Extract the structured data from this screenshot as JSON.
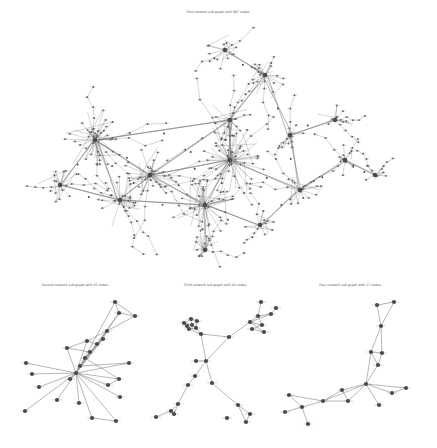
{
  "figure": {
    "background": "#ffffff",
    "node_color": "#4a4a4a",
    "edge_color": "#6a6a6a"
  },
  "main_graph": {
    "title": "First network sub-graph with 987 nodes",
    "node_count": 987,
    "hubs": [
      {
        "x": 95,
        "y": 140,
        "r": 14,
        "n": 40
      },
      {
        "x": 230,
        "y": 160,
        "r": 16,
        "n": 45
      },
      {
        "x": 150,
        "y": 175,
        "r": 13,
        "n": 30
      },
      {
        "x": 205,
        "y": 205,
        "r": 14,
        "n": 32
      },
      {
        "x": 120,
        "y": 200,
        "r": 12,
        "n": 24
      },
      {
        "x": 300,
        "y": 190,
        "r": 10,
        "n": 20
      },
      {
        "x": 265,
        "y": 75,
        "r": 10,
        "n": 18
      },
      {
        "x": 225,
        "y": 50,
        "r": 9,
        "n": 14
      },
      {
        "x": 230,
        "y": 120,
        "r": 10,
        "n": 18
      },
      {
        "x": 335,
        "y": 120,
        "r": 8,
        "n": 12
      },
      {
        "x": 345,
        "y": 160,
        "r": 7,
        "n": 10
      },
      {
        "x": 205,
        "y": 250,
        "r": 8,
        "n": 12
      },
      {
        "x": 60,
        "y": 185,
        "r": 9,
        "n": 14
      },
      {
        "x": 290,
        "y": 135,
        "r": 7,
        "n": 10
      },
      {
        "x": 375,
        "y": 175,
        "r": 6,
        "n": 8
      },
      {
        "x": 260,
        "y": 225,
        "r": 8,
        "n": 10
      }
    ],
    "hub_edges": [
      [
        0,
        2
      ],
      [
        0,
        4
      ],
      [
        0,
        12
      ],
      [
        1,
        2
      ],
      [
        1,
        3
      ],
      [
        1,
        5
      ],
      [
        1,
        8
      ],
      [
        2,
        3
      ],
      [
        2,
        4
      ],
      [
        3,
        11
      ],
      [
        3,
        15
      ],
      [
        5,
        10
      ],
      [
        5,
        13
      ],
      [
        6,
        7
      ],
      [
        6,
        8
      ],
      [
        8,
        1
      ],
      [
        9,
        13
      ],
      [
        10,
        14
      ],
      [
        4,
        12
      ],
      [
        15,
        5
      ],
      [
        6,
        13
      ],
      [
        8,
        2
      ],
      [
        0,
        8
      ],
      [
        3,
        4
      ]
    ]
  },
  "subgraphs": [
    {
      "title": "Second network sub-graph with 25 nodes",
      "node_count": 25,
      "nodes": [
        [
          115,
          302
        ],
        [
          119,
          313
        ],
        [
          135,
          316
        ],
        [
          107,
          331
        ],
        [
          103,
          339
        ],
        [
          87,
          341
        ],
        [
          97,
          344
        ],
        [
          67,
          348
        ],
        [
          90,
          352
        ],
        [
          85,
          358
        ],
        [
          80,
          366
        ],
        [
          76,
          373
        ],
        [
          26,
          363
        ],
        [
          32,
          374
        ],
        [
          39,
          387
        ],
        [
          129,
          363
        ],
        [
          119,
          379
        ],
        [
          70,
          379
        ],
        [
          57,
          400
        ],
        [
          79,
          403
        ],
        [
          108,
          385
        ],
        [
          120,
          397
        ],
        [
          25,
          411
        ],
        [
          92,
          418
        ],
        [
          116,
          421
        ]
      ],
      "edges": [
        [
          0,
          1
        ],
        [
          0,
          2
        ],
        [
          1,
          2
        ],
        [
          1,
          3
        ],
        [
          2,
          3
        ],
        [
          3,
          4
        ],
        [
          3,
          5
        ],
        [
          4,
          6
        ],
        [
          5,
          6
        ],
        [
          4,
          9
        ],
        [
          3,
          10
        ],
        [
          5,
          7
        ],
        [
          6,
          8
        ],
        [
          7,
          8
        ],
        [
          8,
          9
        ],
        [
          9,
          10
        ],
        [
          10,
          11
        ],
        [
          11,
          12
        ],
        [
          11,
          13
        ],
        [
          11,
          14
        ],
        [
          11,
          15
        ],
        [
          11,
          16
        ],
        [
          11,
          17
        ],
        [
          11,
          18
        ],
        [
          11,
          19
        ],
        [
          11,
          20
        ],
        [
          11,
          21
        ],
        [
          11,
          22
        ],
        [
          11,
          23
        ],
        [
          11,
          24
        ],
        [
          10,
          15
        ],
        [
          9,
          16
        ],
        [
          3,
          11
        ],
        [
          4,
          11
        ],
        [
          5,
          11
        ],
        [
          7,
          11
        ],
        [
          16,
          20
        ],
        [
          23,
          24
        ],
        [
          1,
          11
        ],
        [
          0,
          10
        ]
      ]
    },
    {
      "title": "Third network sub-graph with 26 nodes",
      "node_count": 26,
      "nodes": [
        [
          191,
          319
        ],
        [
          184,
          323
        ],
        [
          192,
          325
        ],
        [
          197,
          321
        ],
        [
          196,
          328
        ],
        [
          189,
          329
        ],
        [
          187,
          326
        ],
        [
          201,
          334
        ],
        [
          229,
          337
        ],
        [
          261,
          302
        ],
        [
          258,
          316
        ],
        [
          271,
          314
        ],
        [
          250,
          322
        ],
        [
          262,
          325
        ],
        [
          252,
          329
        ],
        [
          264,
          332
        ],
        [
          276,
          308
        ],
        [
          206,
          361
        ],
        [
          196,
          361
        ],
        [
          195,
          376
        ],
        [
          188,
          385
        ],
        [
          178,
          404
        ],
        [
          171,
          411
        ],
        [
          174,
          414
        ],
        [
          156,
          417
        ],
        [
          212,
          383
        ],
        [
          238,
          405
        ],
        [
          250,
          414
        ],
        [
          246,
          422
        ],
        [
          227,
          418
        ]
      ],
      "edges": [
        [
          0,
          1
        ],
        [
          0,
          2
        ],
        [
          0,
          3
        ],
        [
          1,
          2
        ],
        [
          2,
          3
        ],
        [
          3,
          4
        ],
        [
          4,
          5
        ],
        [
          5,
          6
        ],
        [
          6,
          1
        ],
        [
          2,
          4
        ],
        [
          4,
          7
        ],
        [
          5,
          7
        ],
        [
          7,
          8
        ],
        [
          8,
          12
        ],
        [
          9,
          10
        ],
        [
          10,
          11
        ],
        [
          10,
          12
        ],
        [
          11,
          12
        ],
        [
          12,
          13
        ],
        [
          13,
          14
        ],
        [
          14,
          15
        ],
        [
          12,
          15
        ],
        [
          11,
          16
        ],
        [
          10,
          13
        ],
        [
          7,
          17
        ],
        [
          8,
          17
        ],
        [
          17,
          18
        ],
        [
          17,
          19
        ],
        [
          19,
          20
        ],
        [
          20,
          21
        ],
        [
          21,
          22
        ],
        [
          21,
          23
        ],
        [
          22,
          24
        ],
        [
          22,
          23
        ],
        [
          17,
          25
        ],
        [
          25,
          26
        ],
        [
          26,
          27
        ],
        [
          26,
          28
        ],
        [
          27,
          28
        ]
      ]
    },
    {
      "title": "Four network sub-graph with 17 nodes",
      "node_count": 17,
      "nodes": [
        [
          377,
          305
        ],
        [
          394,
          302
        ],
        [
          381,
          326
        ],
        [
          371,
          352
        ],
        [
          382,
          353
        ],
        [
          378,
          365
        ],
        [
          366,
          384
        ],
        [
          406,
          388
        ],
        [
          392,
          393
        ],
        [
          379,
          405
        ],
        [
          342,
          390
        ],
        [
          323,
          401
        ],
        [
          348,
          401
        ],
        [
          289,
          395
        ],
        [
          302,
          407
        ],
        [
          285,
          412
        ],
        [
          308,
          424
        ]
      ],
      "edges": [
        [
          0,
          1
        ],
        [
          0,
          2
        ],
        [
          1,
          2
        ],
        [
          2,
          3
        ],
        [
          2,
          4
        ],
        [
          3,
          4
        ],
        [
          3,
          5
        ],
        [
          4,
          5
        ],
        [
          5,
          6
        ],
        [
          3,
          6
        ],
        [
          6,
          7
        ],
        [
          6,
          8
        ],
        [
          7,
          8
        ],
        [
          6,
          9
        ],
        [
          6,
          10
        ],
        [
          6,
          11
        ],
        [
          10,
          11
        ],
        [
          10,
          12
        ],
        [
          11,
          12
        ],
        [
          11,
          14
        ],
        [
          11,
          13
        ],
        [
          13,
          14
        ],
        [
          14,
          15
        ],
        [
          14,
          16
        ],
        [
          12,
          6
        ]
      ]
    }
  ]
}
